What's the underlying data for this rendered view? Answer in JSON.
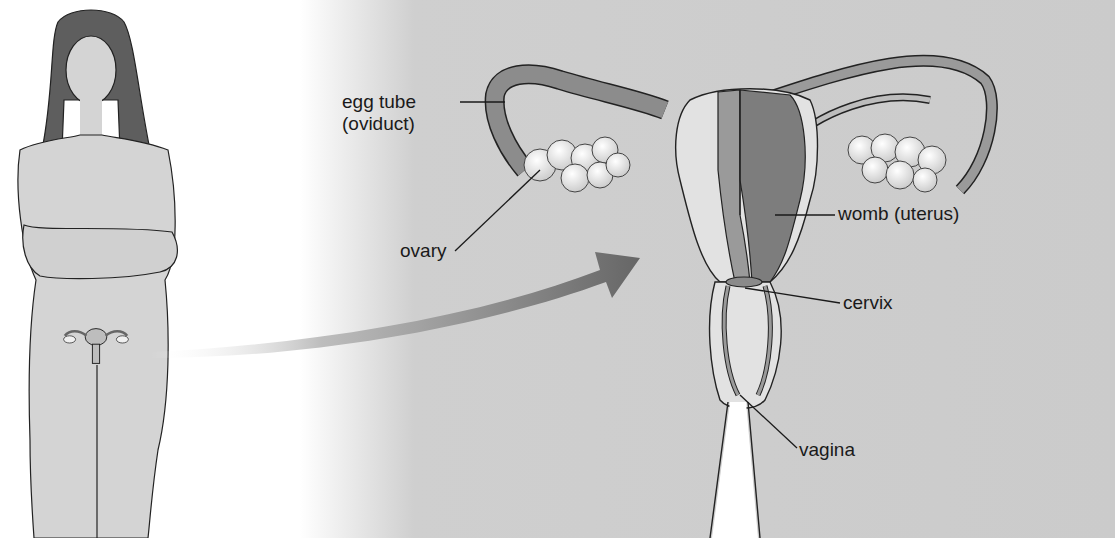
{
  "diagram": {
    "colors": {
      "panel": "#cbcbcb",
      "skin": "#d4d4d4",
      "hair": "#5e5e5e",
      "outline": "#222222",
      "uterus_light": "#e2e2e2",
      "uterus_mid": "#9a9a9a",
      "uterus_dark": "#7d7d7d",
      "ovary": "#f4f4f4",
      "arrow": "#6e6e6e"
    },
    "labels": [
      {
        "id": "oviduct",
        "line1": "egg tube",
        "line2": "(oviduct)"
      },
      {
        "id": "ovary",
        "line1": "ovary"
      },
      {
        "id": "uterus",
        "line1": "womb (uterus)"
      },
      {
        "id": "cervix",
        "line1": "cervix"
      },
      {
        "id": "vagina",
        "line1": "vagina"
      }
    ]
  }
}
